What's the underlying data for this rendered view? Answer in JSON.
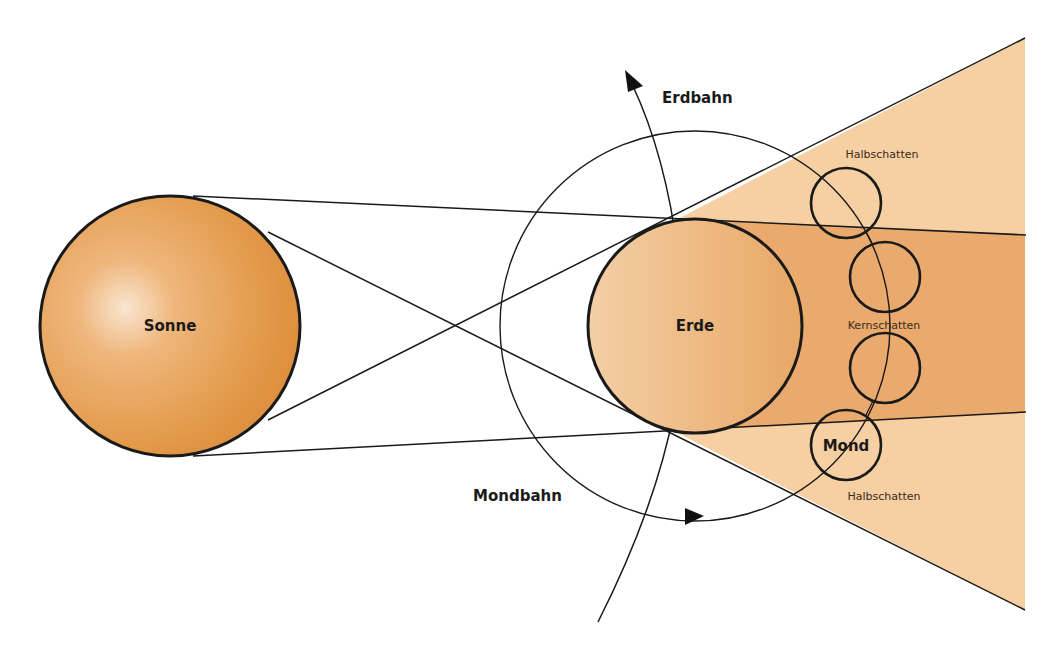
{
  "labels": {
    "sun": "Sonne",
    "earth": "Erde",
    "moon": "Mond",
    "earth_orbit": "Erdbahn",
    "moon_orbit": "Mondbahn",
    "penumbra_top": "Halbschatten",
    "umbra": "Kernschatten",
    "penumbra_bottom": "Halbschatten"
  },
  "colors": {
    "sun_fill": "#E39A4A",
    "sun_highlight": "#F8E2C8",
    "earth_fill": "#EDB77E",
    "penumbra": "#F6CFA3",
    "umbra": "#EAAA6E",
    "line": "#1a1a1a",
    "background": "#ffffff"
  },
  "elements": {
    "sun": {
      "cx": 170,
      "cy": 326,
      "r": 130
    },
    "earth": {
      "cx": 695,
      "cy": 326,
      "r": 107
    },
    "moon_orbit": {
      "cx": 695,
      "cy": 326,
      "r": 195
    },
    "moon_positions": [
      {
        "cx": 846,
        "cy": 203,
        "r": 35
      },
      {
        "cx": 885,
        "cy": 277,
        "r": 35
      },
      {
        "cx": 885,
        "cy": 368,
        "r": 35
      },
      {
        "cx": 846,
        "cy": 445,
        "r": 35
      }
    ]
  }
}
